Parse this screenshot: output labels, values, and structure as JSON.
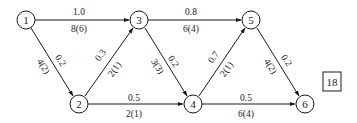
{
  "diagram": {
    "type": "directed-network",
    "colors": {
      "stroke": "#1a1a1a",
      "background": "#ffffff",
      "text": "#1a1a1a"
    },
    "nodes": [
      {
        "id": "1",
        "label": "1",
        "x": 26,
        "y": 20
      },
      {
        "id": "2",
        "label": "2",
        "x": 79,
        "y": 104
      },
      {
        "id": "3",
        "label": "3",
        "x": 139,
        "y": 20
      },
      {
        "id": "4",
        "label": "4",
        "x": 193,
        "y": 104
      },
      {
        "id": "5",
        "label": "5",
        "x": 251,
        "y": 20
      },
      {
        "id": "6",
        "label": "6",
        "x": 305,
        "y": 104
      }
    ],
    "edges": [
      {
        "from": "1",
        "to": "3",
        "cost": "1.0",
        "capacity_flow": "8(6)"
      },
      {
        "from": "1",
        "to": "2",
        "cost": "0.2",
        "capacity_flow": "4(2)"
      },
      {
        "from": "2",
        "to": "3",
        "cost": "0.3",
        "capacity_flow": "2(1)"
      },
      {
        "from": "2",
        "to": "4",
        "cost": "0.5",
        "capacity_flow": "2(1)"
      },
      {
        "from": "3",
        "to": "5",
        "cost": "0.8",
        "capacity_flow": "6(4)"
      },
      {
        "from": "3",
        "to": "4",
        "cost": "0.2",
        "capacity_flow": "3(3)"
      },
      {
        "from": "4",
        "to": "5",
        "cost": "0.7",
        "capacity_flow": "2(1)"
      },
      {
        "from": "4",
        "to": "6",
        "cost": "0.5",
        "capacity_flow": "6(4)"
      },
      {
        "from": "5",
        "to": "6",
        "cost": "0.2",
        "capacity_flow": "4(2)"
      }
    ],
    "answer_box": {
      "label": "18"
    }
  }
}
